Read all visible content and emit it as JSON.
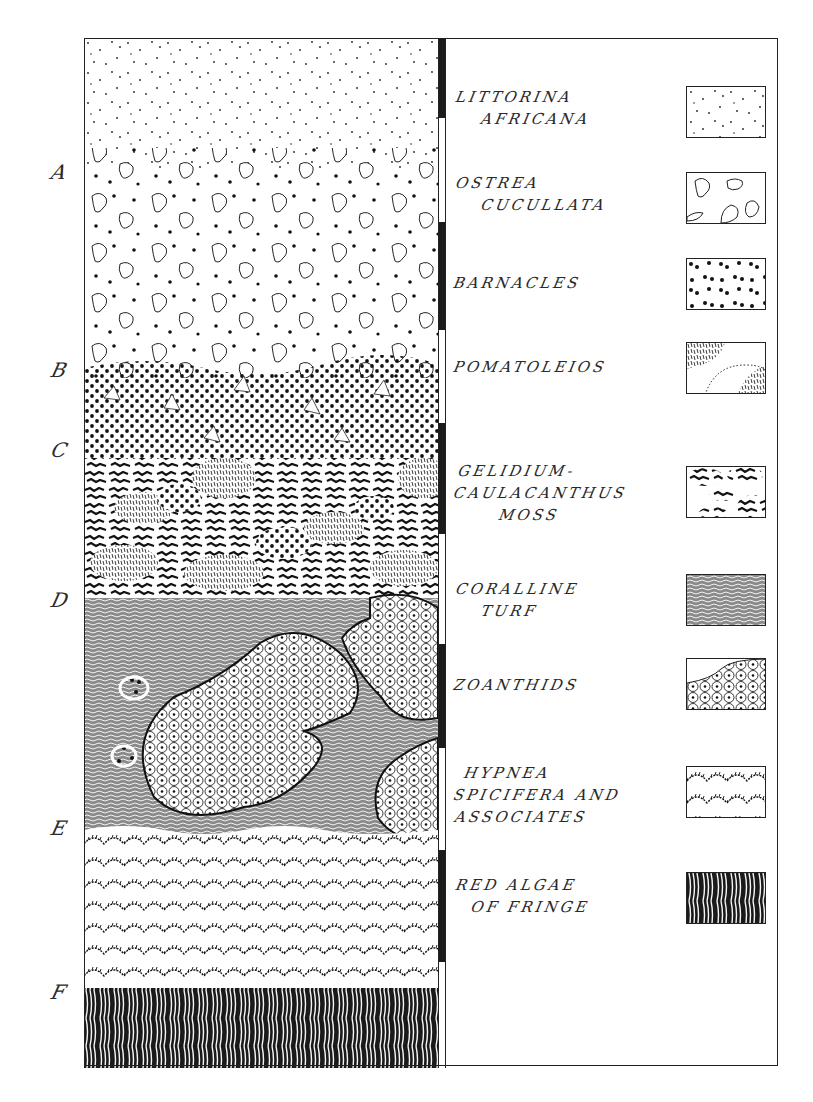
{
  "figure": {
    "zone_markers": [
      {
        "letter": "A",
        "y": 172
      },
      {
        "letter": "B",
        "y": 370
      },
      {
        "letter": "C",
        "y": 450
      },
      {
        "letter": "D",
        "y": 600
      },
      {
        "letter": "E",
        "y": 828
      },
      {
        "letter": "F",
        "y": 992
      }
    ],
    "legend": [
      {
        "label_lines": [
          "LITTORINA",
          "AFRICANA"
        ],
        "pattern": "littorina-dots"
      },
      {
        "label_lines": [
          "OSTREA",
          "CUCULLATA"
        ],
        "pattern": "oyster-shells"
      },
      {
        "label_lines": [
          "BARNACLES"
        ],
        "pattern": "barnacle-dots"
      },
      {
        "label_lines": [
          "POMATOLEIOS"
        ],
        "pattern": "pomatoleios-mounds"
      },
      {
        "label_lines": [
          "GELIDIUM-",
          "CAULACANTHUS",
          "MOSS"
        ],
        "pattern": "gelidium-moss"
      },
      {
        "label_lines": [
          "CORALLINE",
          "TURF"
        ],
        "pattern": "coralline-turf"
      },
      {
        "label_lines": [
          "ZOANTHIDS"
        ],
        "pattern": "zoanthid-polyps"
      },
      {
        "label_lines": [
          "HYPNEA",
          "SPICIFERA AND",
          "ASSOCIATES"
        ],
        "pattern": "hypnea-tufts"
      },
      {
        "label_lines": [
          "RED ALGAE",
          "OF FRINGE"
        ],
        "pattern": "red-algae-strands"
      }
    ],
    "scale_bar_segments": [
      {
        "color": "black",
        "top": 0,
        "height": 80
      },
      {
        "color": "white",
        "top": 80,
        "height": 104
      },
      {
        "color": "black",
        "top": 184,
        "height": 108
      },
      {
        "color": "white",
        "top": 292,
        "height": 93
      },
      {
        "color": "black",
        "top": 385,
        "height": 111
      },
      {
        "color": "white",
        "top": 496,
        "height": 110
      },
      {
        "color": "black",
        "top": 606,
        "height": 104
      },
      {
        "color": "white",
        "top": 710,
        "height": 102
      },
      {
        "color": "black",
        "top": 812,
        "height": 112
      },
      {
        "color": "white",
        "top": 924,
        "height": 106
      }
    ]
  }
}
